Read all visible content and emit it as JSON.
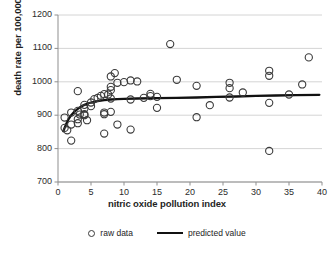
{
  "chart_data": {
    "type": "scatter",
    "title": "",
    "xlabel": "nitric oxide pollution index",
    "ylabel": "death rate per 100,000",
    "xlim": [
      0,
      40
    ],
    "ylim": [
      700,
      1200
    ],
    "xticks": [
      0,
      5,
      10,
      15,
      20,
      25,
      30,
      35,
      40
    ],
    "yticks": [
      700,
      800,
      900,
      1000,
      1100,
      1200
    ],
    "grid": "horizontal",
    "legend_position": "bottom",
    "series": [
      {
        "name": "raw data",
        "type": "scatter",
        "marker": "open-circle",
        "color": "#3a3a3a",
        "points": [
          [
            1,
            893
          ],
          [
            1,
            862
          ],
          [
            1.4,
            855
          ],
          [
            2,
            908
          ],
          [
            2,
            872
          ],
          [
            2,
            824
          ],
          [
            3,
            972
          ],
          [
            3,
            913
          ],
          [
            3,
            888
          ],
          [
            3,
            876
          ],
          [
            3.3,
            902
          ],
          [
            4,
            931
          ],
          [
            4,
            920
          ],
          [
            4,
            903
          ],
          [
            4,
            900
          ],
          [
            4.4,
            885
          ],
          [
            5,
            938
          ],
          [
            5,
            927
          ],
          [
            5.5,
            948
          ],
          [
            6,
            952
          ],
          [
            6.5,
            958
          ],
          [
            7,
            963
          ],
          [
            7,
            908
          ],
          [
            7,
            903
          ],
          [
            7,
            845
          ],
          [
            7.6,
            962
          ],
          [
            8,
            1016
          ],
          [
            8,
            985
          ],
          [
            8,
            975
          ],
          [
            8,
            950
          ],
          [
            8,
            910
          ],
          [
            8.6,
            1026
          ],
          [
            9,
            997
          ],
          [
            9,
            872
          ],
          [
            10,
            999
          ],
          [
            11,
            1004
          ],
          [
            11,
            947
          ],
          [
            11,
            857
          ],
          [
            12,
            1001
          ],
          [
            13,
            952
          ],
          [
            14,
            964
          ],
          [
            14,
            957
          ],
          [
            15,
            955
          ],
          [
            15,
            922
          ],
          [
            17,
            1113
          ],
          [
            18,
            1006
          ],
          [
            21,
            988
          ],
          [
            21,
            894
          ],
          [
            23,
            930
          ],
          [
            26,
            997
          ],
          [
            26,
            981
          ],
          [
            26,
            953
          ],
          [
            28,
            968
          ],
          [
            32,
            1033
          ],
          [
            32,
            1018
          ],
          [
            32,
            937
          ],
          [
            32,
            793
          ],
          [
            35,
            962
          ],
          [
            37,
            992
          ],
          [
            38,
            1073
          ]
        ]
      },
      {
        "name": "predicted value",
        "type": "line",
        "color": "#111111",
        "points": [
          [
            0.8,
            852
          ],
          [
            1.2,
            872
          ],
          [
            1.6,
            888
          ],
          [
            2,
            900
          ],
          [
            2.5,
            911
          ],
          [
            3,
            919
          ],
          [
            3.5,
            926
          ],
          [
            4,
            931
          ],
          [
            4.5,
            935
          ],
          [
            5,
            938
          ],
          [
            6,
            942
          ],
          [
            7,
            945
          ],
          [
            8,
            947
          ],
          [
            9,
            948
          ],
          [
            10,
            949
          ],
          [
            12,
            950
          ],
          [
            15,
            951
          ],
          [
            18,
            952
          ],
          [
            21,
            953
          ],
          [
            24,
            955
          ],
          [
            27,
            956
          ],
          [
            30,
            958
          ],
          [
            33,
            959
          ],
          [
            36,
            960
          ],
          [
            39.6,
            961
          ]
        ]
      }
    ]
  },
  "legend": {
    "items": [
      {
        "label": "raw data",
        "marker": "open-circle"
      },
      {
        "label": "predicted value",
        "marker": "line"
      }
    ]
  }
}
